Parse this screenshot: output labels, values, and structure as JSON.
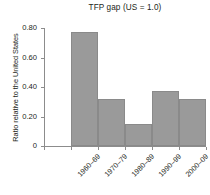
{
  "chart_data": {
    "type": "bar",
    "title": "TFP gap (US = 1.0)",
    "xlabel": "",
    "ylabel": "Ratio relative to the United States",
    "categories": [
      "1960–69",
      "1970–79",
      "1980–89",
      "1990–99",
      "2000–09",
      "2010–17"
    ],
    "values": [
      null,
      0.775,
      0.32,
      0.15,
      0.37,
      0.32
    ],
    "ylim": [
      0,
      0.8
    ],
    "yticks": [
      0,
      0.2,
      0.4,
      0.6,
      0.8
    ],
    "ytick_labels": [
      "0",
      "0.20",
      "0.40",
      "0.60",
      "0.80"
    ],
    "grid": false,
    "legend": null,
    "bar_color": "#9a9a9a",
    "axis_color": "#8c8c8c",
    "text_color": "#231f20"
  }
}
